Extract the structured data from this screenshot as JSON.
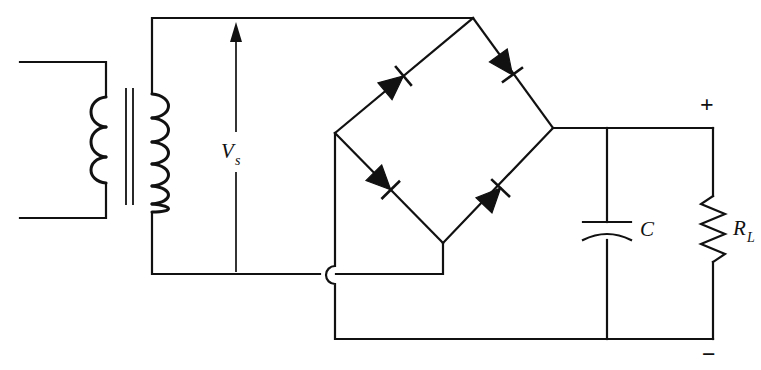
{
  "diagram": {
    "type": "schematic",
    "canvas": {
      "width": 761,
      "height": 370
    },
    "background_color": "#ffffff",
    "line_color": "#111111"
  },
  "labels": {
    "source_voltage": "V",
    "source_voltage_sub": "s",
    "capacitor": "C",
    "load_resistor": "R",
    "load_resistor_sub": "L",
    "output_positive": "+",
    "output_negative": "−"
  },
  "components": [
    {
      "name": "transformer",
      "kind": "transformer",
      "primary_turns": 3,
      "primary_side": "left",
      "secondary_turns": 6,
      "secondary_side": "right",
      "core": "two vertical lines",
      "terminals": "primary leads open at left edge"
    },
    {
      "name": "diode-bridge",
      "kind": "diode-bridge",
      "diode_count": 4,
      "diodes": [
        {
          "position": "upper-left",
          "direction": "up-right",
          "conducts_toward": "top-node"
        },
        {
          "position": "upper-right",
          "direction": "down-right",
          "conducts_toward": "right-node"
        },
        {
          "position": "lower-left",
          "direction": "down-right",
          "conducts_toward": "bottom-node"
        },
        {
          "position": "lower-right",
          "direction": "up-right",
          "conducts_toward": "right-node"
        }
      ],
      "ac_input_nodes": [
        "top",
        "bottom"
      ],
      "dc_output_nodes": [
        "right (+)",
        "left (−)"
      ]
    },
    {
      "name": "filter-capacitor",
      "kind": "capacitor",
      "style": "polarized",
      "label": "C"
    },
    {
      "name": "load-resistor",
      "kind": "resistor",
      "style": "zigzag",
      "zigzag_segments": 7,
      "label": "R_L"
    }
  ],
  "annotations": [
    {
      "name": "source-voltage-arrow",
      "text": "Vs",
      "direction": "up",
      "meaning": "secondary voltage across transformer output"
    },
    {
      "name": "wire-crossing-hop",
      "style": "semicircular jump",
      "meaning": "wires cross without connecting"
    },
    {
      "name": "output-polarity-plus",
      "text": "+",
      "location": "top-right"
    },
    {
      "name": "output-polarity-minus",
      "text": "−",
      "location": "bottom-right"
    }
  ]
}
